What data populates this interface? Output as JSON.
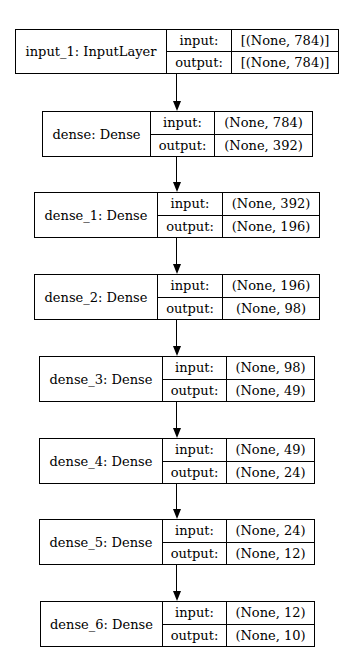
{
  "diagram": {
    "type": "keras-model-plot",
    "port_labels": {
      "input": "input:",
      "output": "output:"
    },
    "nodes": [
      {
        "name": "input_1: InputLayer",
        "input": "[(None, 784)]",
        "output": "[(None, 784)]"
      },
      {
        "name": "dense: Dense",
        "input": "(None, 784)",
        "output": "(None, 392)"
      },
      {
        "name": "dense_1: Dense",
        "input": "(None, 392)",
        "output": "(None, 196)"
      },
      {
        "name": "dense_2: Dense",
        "input": "(None, 196)",
        "output": "(None, 98)"
      },
      {
        "name": "dense_3: Dense",
        "input": "(None, 98)",
        "output": "(None, 49)"
      },
      {
        "name": "dense_4: Dense",
        "input": "(None, 49)",
        "output": "(None, 24)"
      },
      {
        "name": "dense_5: Dense",
        "input": "(None, 24)",
        "output": "(None, 12)"
      },
      {
        "name": "dense_6: Dense",
        "input": "(None, 12)",
        "output": "(None, 10)"
      }
    ],
    "edges": [
      {
        "from": "input_1",
        "to": "dense"
      },
      {
        "from": "dense",
        "to": "dense_1"
      },
      {
        "from": "dense_1",
        "to": "dense_2"
      },
      {
        "from": "dense_2",
        "to": "dense_3"
      },
      {
        "from": "dense_3",
        "to": "dense_4"
      },
      {
        "from": "dense_4",
        "to": "dense_5"
      },
      {
        "from": "dense_5",
        "to": "dense_6"
      }
    ],
    "colors": {
      "stroke": "#000000",
      "background": "#ffffff",
      "text": "#000000"
    }
  }
}
